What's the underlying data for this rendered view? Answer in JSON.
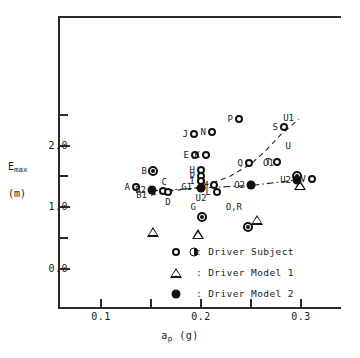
{
  "chart_data": {
    "type": "scatter",
    "title": "",
    "xlabel": "a_p (g)",
    "ylabel": "E_max (m)",
    "xlim": [
      0.05,
      0.33
    ],
    "ylim": [
      0.0,
      2.72
    ],
    "grid": false,
    "legend_position": "inside-bottom-center",
    "x_ticks": [
      {
        "value": 0.1,
        "label": "0.1",
        "major": true
      },
      {
        "value": 0.15,
        "label": "",
        "major": false
      },
      {
        "value": 0.2,
        "label": "0.2",
        "major": true
      },
      {
        "value": 0.25,
        "label": "",
        "major": false
      },
      {
        "value": 0.3,
        "label": "0.3",
        "major": true
      }
    ],
    "y_ticks": [
      {
        "value": 0.0,
        "label": "0.0",
        "major": true
      },
      {
        "value": 0.5,
        "label": "",
        "major": false
      },
      {
        "value": 1.0,
        "label": "1.0",
        "major": true
      },
      {
        "value": 1.5,
        "label": "",
        "major": false
      },
      {
        "value": 2.0,
        "label": "2.0",
        "major": true
      },
      {
        "value": 2.5,
        "label": "",
        "major": false
      }
    ],
    "series": [
      {
        "name": "Driver Subject",
        "marker": "open-circle",
        "points": [
          {
            "label": "A",
            "x": 0.135,
            "y": 1.33,
            "label_pos": "left"
          },
          {
            "label": "C",
            "x": 0.162,
            "y": 1.26,
            "label_pos": "above"
          },
          {
            "label": "D",
            "x": 0.167,
            "y": 1.24,
            "label_pos": "below"
          },
          {
            "label": "E",
            "x": 0.194,
            "y": 1.84,
            "label_pos": "left"
          },
          {
            "label": "K",
            "x": 0.205,
            "y": 1.84,
            "label_pos": "left"
          },
          {
            "label": "H",
            "x": 0.2,
            "y": 1.6,
            "label_pos": "left"
          },
          {
            "label": "P",
            "x": 0.2,
            "y": 1.51,
            "label_pos": "left"
          },
          {
            "label": "I",
            "x": 0.2,
            "y": 1.42,
            "label_pos": "left"
          },
          {
            "label": "M",
            "x": 0.213,
            "y": 1.36,
            "label_pos": "left"
          },
          {
            "label": "L",
            "x": 0.216,
            "y": 1.24,
            "label_pos": "left"
          },
          {
            "label": "J",
            "x": 0.193,
            "y": 2.18,
            "label_pos": "left"
          },
          {
            "label": "N",
            "x": 0.211,
            "y": 2.22,
            "label_pos": "left"
          },
          {
            "label": "P",
            "x": 0.238,
            "y": 2.43,
            "label_pos": "left"
          },
          {
            "label": "Q",
            "x": 0.248,
            "y": 1.72,
            "label_pos": "left"
          },
          {
            "label": "T",
            "x": 0.276,
            "y": 1.73,
            "label_pos": "left"
          },
          {
            "label": "S",
            "x": 0.283,
            "y": 2.3,
            "label_pos": "left"
          },
          {
            "label": "V",
            "x": 0.311,
            "y": 1.45,
            "label_pos": "left"
          }
        ]
      },
      {
        "name": "Driver Subject (bullseye)",
        "marker": "bullseye",
        "points": [
          {
            "label": "B",
            "x": 0.152,
            "y": 1.58,
            "label_pos": "left"
          },
          {
            "label": "G",
            "x": 0.201,
            "y": 1.0,
            "label_pos": "left"
          },
          {
            "label": "O,R",
            "x": 0.247,
            "y": 1.0,
            "label_pos": "left"
          },
          {
            "label": "U",
            "x": 0.296,
            "y": 2.0,
            "label_pos": "left"
          }
        ]
      },
      {
        "name": "Driver Model 1",
        "marker": "triangle",
        "points": [
          {
            "label": "B1",
            "x": 0.152,
            "y": 1.2,
            "label_pos": "left"
          },
          {
            "label": "G1",
            "x": 0.197,
            "y": 1.32,
            "label_pos": "left"
          },
          {
            "label": "O1",
            "x": 0.256,
            "y": 1.72,
            "label_pos": "right"
          },
          {
            "label": "U1",
            "x": 0.299,
            "y": 2.44,
            "label_pos": "left"
          }
        ]
      },
      {
        "name": "Driver Model 2",
        "marker": "filled-circle",
        "points": [
          {
            "label": "B2",
            "x": 0.151,
            "y": 1.27,
            "label_pos": "left"
          },
          {
            "label": "U2",
            "x": 0.2,
            "y": 1.31,
            "label_pos": "below"
          },
          {
            "label": "O2",
            "x": 0.25,
            "y": 1.35,
            "label_pos": "left"
          },
          {
            "label": "U2",
            "x": 0.296,
            "y": 1.44,
            "label_pos": "left"
          }
        ]
      }
    ],
    "trend_lines": [
      {
        "name": "driver-model-1-curve",
        "style": "dashed",
        "points": [
          [
            0.15,
            1.19
          ],
          [
            0.165,
            1.25
          ],
          [
            0.198,
            1.32
          ],
          [
            0.228,
            1.49
          ],
          [
            0.25,
            1.7
          ],
          [
            0.265,
            1.92
          ],
          [
            0.28,
            2.18
          ],
          [
            0.298,
            2.43
          ]
        ]
      },
      {
        "name": "driver-model-2-curve",
        "style": "dash-dot",
        "points": [
          [
            0.15,
            1.26
          ],
          [
            0.2,
            1.31
          ],
          [
            0.25,
            1.35
          ],
          [
            0.296,
            1.44
          ]
        ]
      }
    ],
    "legend": [
      {
        "symbols": [
          "open-circle",
          "half-circle"
        ],
        "text": ": Driver Subject"
      },
      {
        "symbols": [
          "triangle"
        ],
        "text": ": Driver Model 1"
      },
      {
        "symbols": [
          "filled-circle"
        ],
        "text": ": Driver Model 2"
      }
    ],
    "axis_titles": {
      "y_main": "E",
      "y_sub": "max",
      "y_unit": "(m)",
      "x_main": "a",
      "x_sub": "p",
      "x_unit": "(g)"
    }
  }
}
